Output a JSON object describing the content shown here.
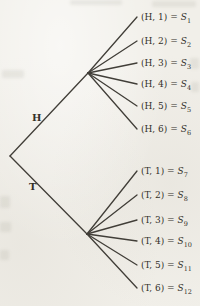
{
  "diagram": {
    "type": "tree",
    "root_branches": [
      {
        "label": "H"
      },
      {
        "label": "T"
      }
    ],
    "leaves": [
      {
        "prefix": "(H, 1) =",
        "state": "S",
        "sub": "1"
      },
      {
        "prefix": "(H, 2) =",
        "state": "S",
        "sub": "2"
      },
      {
        "prefix": "(H, 3) =",
        "state": "S",
        "sub": "3"
      },
      {
        "prefix": "(H, 4) =",
        "state": "S",
        "sub": "4"
      },
      {
        "prefix": "(H, 5) =",
        "state": "S",
        "sub": "5"
      },
      {
        "prefix": "(H, 6) =",
        "state": "S",
        "sub": "6"
      },
      {
        "prefix": "(T, 1) =",
        "state": "S",
        "sub": "7"
      },
      {
        "prefix": "(T, 2) =",
        "state": "S",
        "sub": "8"
      },
      {
        "prefix": "(T, 3) =",
        "state": "S",
        "sub": "9"
      },
      {
        "prefix": "(T, 4) =",
        "state": "S",
        "sub": "10"
      },
      {
        "prefix": "(T, 5) =",
        "state": "S",
        "sub": "11"
      },
      {
        "prefix": "(T, 6) =",
        "state": "S",
        "sub": "12"
      }
    ]
  },
  "colors": {
    "line": "#413e38",
    "text": "#33302a",
    "background": "#f1efe9"
  }
}
